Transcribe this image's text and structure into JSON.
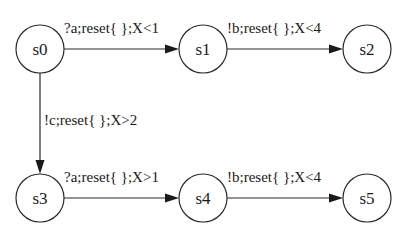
{
  "diagram": {
    "type": "state-machine",
    "nodes": [
      {
        "id": "s0",
        "label": "s0",
        "cx": 40,
        "cy": 49
      },
      {
        "id": "s1",
        "label": "s1",
        "cx": 203,
        "cy": 49
      },
      {
        "id": "s2",
        "label": "s2",
        "cx": 367,
        "cy": 49
      },
      {
        "id": "s3",
        "label": "s3",
        "cx": 40,
        "cy": 198
      },
      {
        "id": "s4",
        "label": "s4",
        "cx": 203,
        "cy": 198
      },
      {
        "id": "s5",
        "label": "s5",
        "cx": 367,
        "cy": 198
      }
    ],
    "edges": [
      {
        "from": "s0",
        "to": "s1",
        "label": "?a;reset{ };X<1"
      },
      {
        "from": "s1",
        "to": "s2",
        "label": "!b;reset{ };X<4"
      },
      {
        "from": "s0",
        "to": "s3",
        "label": "!c;reset{ };X>2"
      },
      {
        "from": "s3",
        "to": "s4",
        "label": "?a;reset{ };X>1"
      },
      {
        "from": "s4",
        "to": "s5",
        "label": "!b;reset{ };X<4"
      }
    ]
  }
}
